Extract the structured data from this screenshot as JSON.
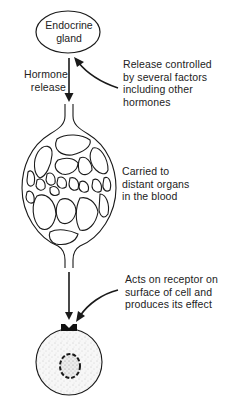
{
  "diagram": {
    "type": "flow",
    "title": "",
    "nodes": [
      {
        "id": "gland",
        "label_lines": [
          "Endocrine",
          "gland"
        ],
        "shape": "ellipse"
      },
      {
        "id": "blood",
        "label": "capillary network",
        "shape": "vessel"
      },
      {
        "id": "cell",
        "label": "target cell",
        "shape": "circle"
      }
    ],
    "annotations": {
      "hormone_release": [
        "Hormone",
        "release"
      ],
      "release_control": [
        "Release controlled",
        "by several factors",
        "including other",
        "hormones"
      ],
      "carried": [
        "Carried to",
        "distant organs",
        "in the blood"
      ],
      "acts_on": [
        "Acts on receptor on",
        "surface of cell and",
        "produces its effect"
      ]
    },
    "edges": [
      {
        "from": "gland",
        "to": "blood",
        "label": "Hormone release"
      },
      {
        "from": "blood",
        "to": "cell",
        "label": "Acts on receptor"
      }
    ],
    "colors": {
      "stroke": "#1a1a1a",
      "cell_fill": "#f2f2f2",
      "background": "#ffffff"
    }
  }
}
